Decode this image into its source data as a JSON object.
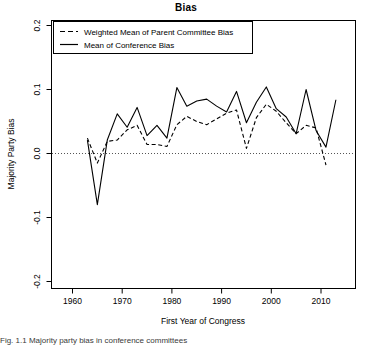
{
  "figure": {
    "title": "Bias",
    "caption_partial": "Fig. 1.1  Majority party bias in conference committees"
  },
  "chart_data": {
    "type": "line",
    "title": "Bias",
    "xlabel": "First Year of Congress",
    "ylabel": "Majority Party Bias",
    "xlim": [
      1957,
      2015
    ],
    "ylim": [
      -0.22,
      0.22
    ],
    "xticks": [
      1960,
      1970,
      1980,
      1990,
      2000,
      2010
    ],
    "yticks": [
      -0.2,
      -0.1,
      0.0,
      0.1,
      0.2
    ],
    "ytick_labels": [
      "-0.2",
      "-0.1",
      "0.0",
      "0.1",
      "0.2"
    ],
    "xtick_labels": [
      "1960",
      "1970",
      "1980",
      "1990",
      "2000",
      "2010"
    ],
    "grid": false,
    "zero_reference_line": 0.0,
    "legend_position": "top-left",
    "x": [
      1963,
      1965,
      1967,
      1969,
      1971,
      1973,
      1975,
      1977,
      1979,
      1981,
      1983,
      1985,
      1987,
      1989,
      1991,
      1993,
      1995,
      1997,
      1999,
      2001,
      2003,
      2005,
      2007,
      2009,
      2011,
      2013
    ],
    "series": [
      {
        "name": "Weighted Mean of Parent Committee Bias",
        "style": "dashed",
        "color": "#000000",
        "values": [
          0.024,
          -0.015,
          0.019,
          0.021,
          0.037,
          0.044,
          0.014,
          0.014,
          0.011,
          0.045,
          0.058,
          0.05,
          0.045,
          0.054,
          0.063,
          0.068,
          0.008,
          0.056,
          0.077,
          0.066,
          0.048,
          0.031,
          0.044,
          0.04,
          -0.018,
          null
        ]
      },
      {
        "name": "Mean of Conference Bias",
        "style": "solid",
        "color": "#000000",
        "values": [
          0.021,
          -0.08,
          0.021,
          0.062,
          0.041,
          0.072,
          0.028,
          0.044,
          0.024,
          0.103,
          0.074,
          0.082,
          0.085,
          0.074,
          0.065,
          0.097,
          0.048,
          0.08,
          0.104,
          0.07,
          0.057,
          0.031,
          0.1,
          0.036,
          0.01,
          0.084
        ]
      }
    ]
  },
  "legend": {
    "items": [
      {
        "label": "Weighted Mean of Parent Committee Bias",
        "style": "dashed"
      },
      {
        "label": "Mean of Conference Bias",
        "style": "solid"
      }
    ]
  }
}
